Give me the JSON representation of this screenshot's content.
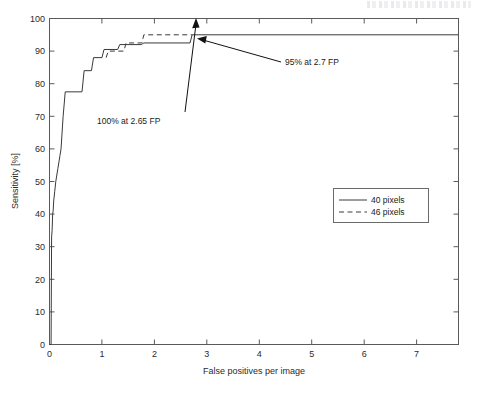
{
  "figure": {
    "scan_artifact": "illegible-header-smudge"
  },
  "chart_data": {
    "type": "line",
    "title": "",
    "xlabel": "False positives per image",
    "ylabel": "Sensitivity [%]",
    "xlim": [
      0,
      7.8
    ],
    "ylim": [
      0,
      100
    ],
    "xticks": [
      0,
      1,
      2,
      3,
      4,
      5,
      6,
      7
    ],
    "xtick_labels": [
      "0",
      "1",
      "2",
      "3",
      "4",
      "5",
      "6",
      "7"
    ],
    "yticks": [
      0,
      10,
      20,
      30,
      40,
      50,
      60,
      70,
      80,
      90,
      100
    ],
    "ytick_labels": [
      "0",
      "10",
      "20",
      "30",
      "40",
      "50",
      "60",
      "70",
      "80",
      "90",
      "100"
    ],
    "grid": false,
    "legend_position": "center-right",
    "series": [
      {
        "name": "40 pixels",
        "style": "solid",
        "x": [
          0.0,
          0.03,
          0.04,
          0.05,
          0.06,
          0.07,
          0.08,
          0.1,
          0.12,
          0.14,
          0.16,
          0.18,
          0.2,
          0.22,
          0.26,
          0.3,
          0.62,
          0.66,
          0.8,
          0.84,
          1.0,
          1.04,
          1.3,
          1.34,
          1.75,
          1.8,
          2.68,
          2.72,
          7.8
        ],
        "y": [
          0.0,
          0.0,
          33.0,
          35.0,
          40.0,
          41.0,
          44.0,
          47.0,
          50.0,
          52.0,
          54.0,
          56.0,
          58.0,
          60.0,
          70.0,
          77.5,
          77.5,
          84.0,
          84.0,
          88.0,
          88.0,
          90.5,
          90.5,
          92.0,
          92.0,
          92.5,
          92.5,
          95.0,
          95.0
        ]
      },
      {
        "name": "46 pixels",
        "style": "dashed",
        "x": [
          1.08,
          1.12,
          1.42,
          1.46,
          1.76,
          1.8,
          2.68,
          2.72
        ],
        "y": [
          88.0,
          90.0,
          90.0,
          92.5,
          92.5,
          95.0,
          95.0,
          95.0
        ]
      }
    ],
    "annotations": [
      {
        "id": "anno-100",
        "text": "100% at 2.65 FP",
        "target_x": 2.65,
        "target_y": 100.0
      },
      {
        "id": "anno-95",
        "text": "95% at 2.7 FP",
        "target_x": 2.7,
        "target_y": 95.0
      }
    ]
  }
}
